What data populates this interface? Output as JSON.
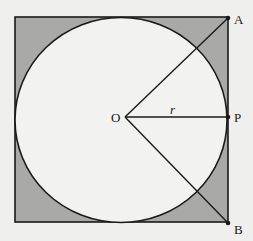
{
  "diagram": {
    "colors": {
      "background": "#efefed",
      "shaded_region": "#a9a9a7",
      "circle_fill": "#f2f2f0",
      "stroke": "#1a1a1a"
    },
    "square": {
      "x": 15,
      "y": 17,
      "width": 213,
      "height": 205
    },
    "circle": {
      "cx": 121,
      "cy": 120,
      "r": 106
    },
    "points": {
      "O": {
        "label": "O",
        "x": 125,
        "y": 117
      },
      "A": {
        "label": "A",
        "x": 228,
        "y": 18
      },
      "P": {
        "label": "P",
        "x": 228,
        "y": 117
      },
      "B": {
        "label": "B",
        "x": 228,
        "y": 223
      }
    },
    "segments": [
      {
        "from": "O",
        "to": "A"
      },
      {
        "from": "O",
        "to": "P",
        "label": "r"
      },
      {
        "from": "O",
        "to": "B"
      }
    ],
    "labels": {
      "O": "O",
      "A": "A",
      "P": "P",
      "B": "B",
      "r": "r"
    }
  }
}
